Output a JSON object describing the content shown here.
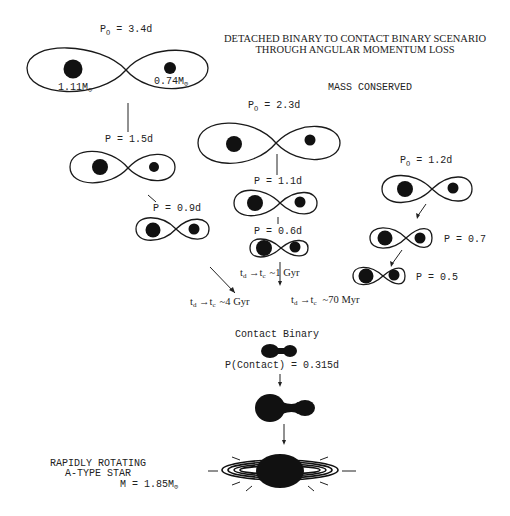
{
  "title": {
    "line1": "DETACHED BINARY TO CONTACT BINARY SCENARIO",
    "line2": "THROUGH ANGULAR MOMENTUM LOSS"
  },
  "subtitle": "MASS CONSERVED",
  "track_a": {
    "initial": {
      "p_label": "P",
      "p_sub": "O",
      "p_value": " = 3.4d",
      "mass1": "1.11M",
      "mass2": "0.74M",
      "sun": "⊙"
    },
    "step1": {
      "label": "P = 1.5d"
    },
    "step2": {
      "label": "P = 0.9d"
    },
    "timescale": {
      "td": "t",
      "td_sub": "d",
      "tc": "t",
      "tc_sub": "c",
      "value": "~4 Gyr"
    }
  },
  "track_b": {
    "initial": {
      "p_label": "P",
      "p_sub": "O",
      "p_value": " = 2.3d"
    },
    "step1": {
      "label": "P = 1.1d"
    },
    "step2": {
      "label": "P = 0.6d"
    },
    "timescale": {
      "td": "t",
      "td_sub": "d",
      "tc": "t",
      "tc_sub": "c",
      "value": "~1 Gyr"
    }
  },
  "track_c": {
    "initial": {
      "p_label": "P",
      "p_sub": "O",
      "p_value": " = 1.2d"
    },
    "step1": {
      "label": "P = 0.7"
    },
    "step2": {
      "label": "P = 0.5"
    },
    "timescale": {
      "td": "t",
      "td_sub": "d",
      "tc": "t",
      "tc_sub": "c",
      "value": "~70 Myr"
    }
  },
  "contact": {
    "heading": "Contact Binary",
    "period": "P(Contact) = 0.315d"
  },
  "final": {
    "line1": "RAPIDLY ROTATING",
    "line2": "A-TYPE STAR",
    "mass": "M = 1.85M",
    "sun": "⊙"
  }
}
